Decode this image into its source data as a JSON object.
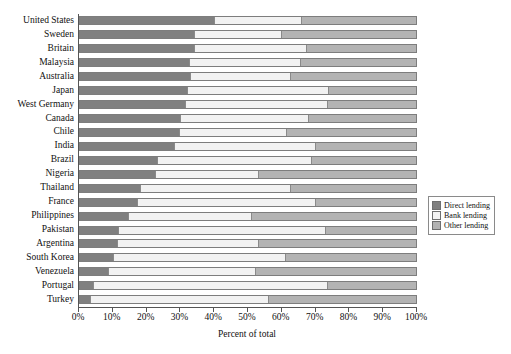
{
  "chart_data": {
    "type": "bar",
    "orientation": "horizontal",
    "stacked": true,
    "title": "",
    "xlabel": "Percent of total",
    "ylabel": "",
    "xlim": [
      0,
      100
    ],
    "xticks": [
      "0%",
      "10%",
      "20%",
      "30%",
      "40%",
      "50%",
      "60%",
      "70%",
      "80%",
      "90%",
      "100%"
    ],
    "xtick_values": [
      0,
      10,
      20,
      30,
      40,
      50,
      60,
      70,
      80,
      90,
      100
    ],
    "grid": false,
    "legend_position": "right",
    "categories": [
      "United States",
      "Sweden",
      "Britain",
      "Malaysia",
      "Australia",
      "Japan",
      "West Germany",
      "Canada",
      "Chile",
      "India",
      "Brazil",
      "Nigeria",
      "Thailand",
      "France",
      "Philippines",
      "Pakistan",
      "Argentina",
      "South Korea",
      "Venezuela",
      "Portugal",
      "Turkey"
    ],
    "series": [
      {
        "name": "Direct lending",
        "color": "#808080",
        "values": [
          40,
          34,
          34,
          32.5,
          33,
          32,
          31.5,
          30,
          29.5,
          28,
          23,
          22.5,
          18,
          17,
          14.5,
          11.5,
          11,
          10,
          8.5,
          4,
          3
        ]
      },
      {
        "name": "Bank lending",
        "color": "#f2f2f2",
        "values": [
          26,
          26,
          33.5,
          33,
          29.5,
          42,
          42,
          38,
          32,
          42,
          46,
          30.5,
          44.5,
          53,
          36.5,
          61.5,
          42,
          51,
          43.5,
          69.5,
          53
        ]
      },
      {
        "name": "Other lending",
        "color": "#b3b3b3",
        "values": [
          34,
          40,
          32.5,
          34.5,
          37.5,
          26,
          26.5,
          32,
          38.5,
          30,
          31,
          47,
          37.5,
          30,
          49,
          27,
          47,
          39,
          48,
          26.5,
          44
        ]
      }
    ]
  },
  "legend": {
    "items": [
      {
        "label": "Direct lending",
        "color": "#808080"
      },
      {
        "label": "Bank lending",
        "color": "#f2f2f2"
      },
      {
        "label": "Other lending",
        "color": "#b3b3b3"
      }
    ]
  }
}
